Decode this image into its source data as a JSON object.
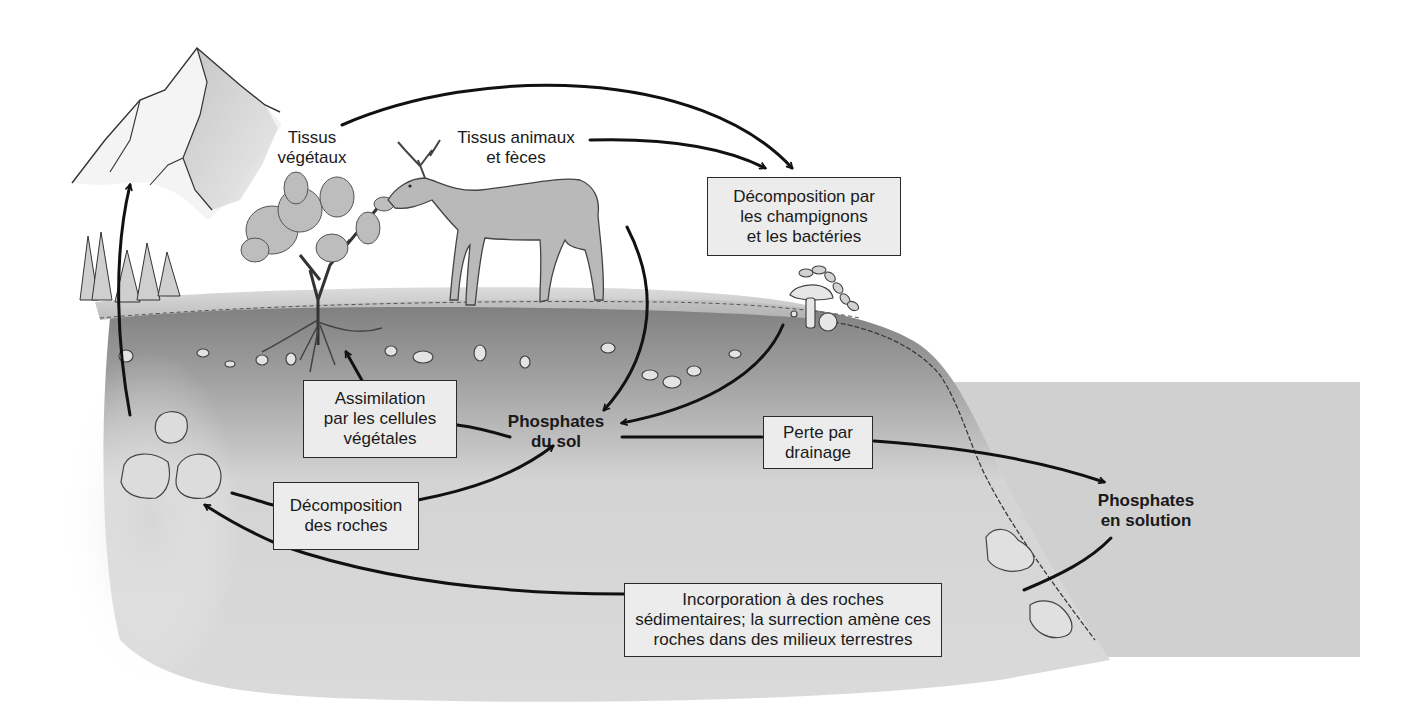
{
  "diagram": {
    "type": "cycle-illustration",
    "colors": {
      "background": "#ffffff",
      "soil_dark": "#8f8f8f",
      "soil_light": "#d6d6d6",
      "water": "#cfcfcf",
      "arrow": "#111111",
      "box_fill": "#ececec",
      "box_border": "#2a2a2a"
    },
    "labels": {
      "plant_tissue": {
        "line1": "Tissus",
        "line2": "végétaux"
      },
      "animal_tissue": {
        "line1": "Tissus animaux",
        "line2": "et fèces"
      },
      "soil_phosphate": {
        "line1": "Phosphates",
        "line2": "du sol"
      },
      "dissolved_phosphate": {
        "line1": "Phosphates",
        "line2": "en solution"
      }
    },
    "boxes": {
      "decomposition_fungi": {
        "line1": "Décomposition par",
        "line2": "les champignons",
        "line3": "et les bactéries"
      },
      "assimilation": {
        "line1": "Assimilation",
        "line2": "par les cellules",
        "line3": "végétales"
      },
      "drainage": {
        "line1": "Perte par",
        "line2": "drainage"
      },
      "rock_weathering": {
        "line1": "Décomposition",
        "line2": "des roches"
      },
      "sedimentation": {
        "line1": "Incorporation à des roches",
        "line2": "sédimentaires; la surrection amène ces",
        "line3": "roches dans des milieux terrestres"
      }
    },
    "icons": [
      "mountain-icon",
      "pine-trees-icon",
      "shrub-icon",
      "deer-icon",
      "mushroom-icon",
      "bacteria-chain-icon",
      "rock-icon",
      "soil-pebbles-icon",
      "water-body-icon"
    ],
    "flows": [
      {
        "from": "Tissus végétaux",
        "to": "Décomposition par les champignons et les bactéries"
      },
      {
        "from": "Tissus animaux et fèces",
        "to": "Décomposition par les champignons et les bactéries"
      },
      {
        "from": "Tissus animaux et fèces",
        "to": "Phosphates du sol"
      },
      {
        "from": "Décomposition par les champignons et les bactéries",
        "to": "Phosphates du sol"
      },
      {
        "from": "Phosphates du sol",
        "to": "Tissus végétaux",
        "via": "Assimilation par les cellules végétales"
      },
      {
        "from": "Rochers",
        "to": "Phosphates du sol",
        "via": "Décomposition des roches"
      },
      {
        "from": "Phosphates du sol",
        "to": "Phosphates en solution",
        "via": "Perte par drainage"
      },
      {
        "from": "Phosphates en solution",
        "to": "Rochers",
        "via": "Incorporation à des roches sédimentaires"
      },
      {
        "from": "Rochers",
        "to": "Montagne",
        "via": "surrection"
      }
    ]
  }
}
